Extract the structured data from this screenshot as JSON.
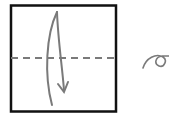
{
  "diagram": {
    "type": "origami-fold-step",
    "colors": {
      "paper_border": "#111111",
      "fold_line": "#7a7a7a",
      "arrow": "#7a7a7a",
      "background": "#ffffff"
    },
    "paper": {
      "shape": "square"
    },
    "fold_line": {
      "style": "dashed",
      "orientation": "horizontal",
      "position": "middle"
    },
    "arrow": {
      "direction": "down",
      "meaning": "valley-fold-top-to-bottom"
    },
    "side_symbol": {
      "name": "turn-over-symbol"
    }
  }
}
